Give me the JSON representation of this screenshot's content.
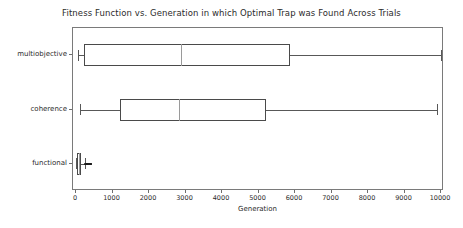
{
  "chart_data": {
    "type": "box",
    "title": "Fitness Function vs. Generation in which Optimal Trap was Found Across Trials",
    "xlabel": "Generation",
    "ylabel": "",
    "xlim": [
      0,
      10000
    ],
    "xticks": [
      0,
      1000,
      2000,
      3000,
      4000,
      5000,
      6000,
      7000,
      8000,
      9000,
      10000
    ],
    "xticklabels": [
      "0",
      "1000",
      "2000",
      "3000",
      "4000",
      "5000",
      "6000",
      "7000",
      "8000",
      "9000",
      "10000"
    ],
    "categories": [
      "multiobjective",
      "coherence",
      "functional"
    ],
    "orientation": "horizontal",
    "grid": false,
    "legend": null,
    "boxes": [
      {
        "label": "multiobjective",
        "whisker_low": 60,
        "q1": 220,
        "median": 2880,
        "q3": 5860,
        "whisker_high": 10000,
        "fliers": []
      },
      {
        "label": "coherence",
        "whisker_low": 120,
        "q1": 1200,
        "median": 2820,
        "q3": 5200,
        "whisker_high": 9880,
        "fliers": []
      },
      {
        "label": "functional",
        "whisker_low": 5,
        "q1": 30,
        "median": 75,
        "q3": 140,
        "whisker_high": 240,
        "fliers": [
          255,
          270,
          285,
          300,
          310,
          325,
          340,
          355,
          370,
          385,
          400,
          415
        ]
      }
    ]
  }
}
